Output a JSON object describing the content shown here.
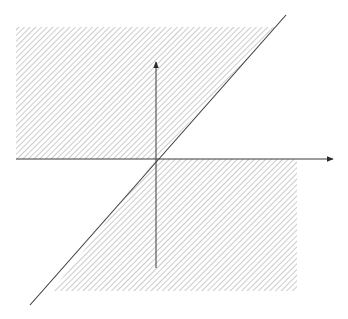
{
  "diagram": {
    "background": "#ffffff",
    "hatch_color": "#b4b4b4",
    "line_color": "#3a3a3a",
    "axes": {
      "x_axis": {
        "x1": 16,
        "y": 159,
        "x2": 333
      },
      "y_axis": {
        "x": 156,
        "y1": 268,
        "y2": 62
      },
      "origin": {
        "x": 156,
        "y": 159
      }
    },
    "diagonal_line": {
      "x1": 30,
      "y1": 305,
      "x2": 286,
      "y2": 15
    },
    "hatched_regions": [
      {
        "name": "upper-left-region",
        "points": "16,27 276,27 156,159 16,159"
      },
      {
        "name": "lower-right-region",
        "points": "156,159 297,159 297,291 52,291"
      }
    ]
  }
}
